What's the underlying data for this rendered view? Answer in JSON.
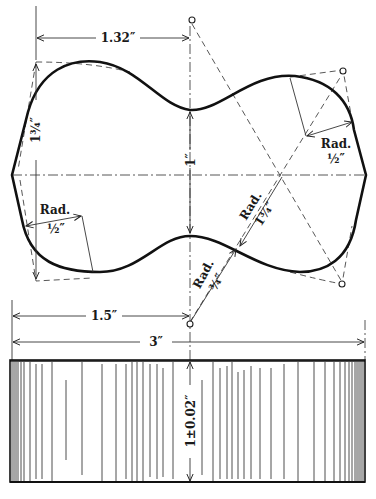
{
  "figure": {
    "type": "engineering drawing"
  },
  "dimensions": {
    "top_offset": "1.32″",
    "left_height": "1¾″",
    "neck_width": "1″",
    "half_length": "1.5″",
    "overall_length": "3″",
    "thickness": "1±0.02″"
  },
  "radius_labels": {
    "upper_right": {
      "title": "Rad.",
      "value": "½″"
    },
    "lower_left": {
      "title": "Rad.",
      "value": "½″"
    },
    "center_large": {
      "title": "Rad.",
      "value": "1¾″"
    },
    "lower_center": {
      "title": "Rad.",
      "value": "¾″"
    }
  },
  "colors": {
    "ink": "#111111",
    "paper": "#ffffff"
  }
}
